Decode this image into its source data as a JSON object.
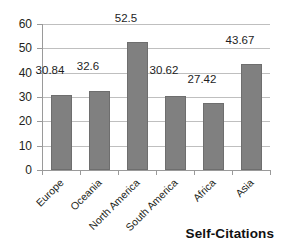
{
  "chart_data": {
    "type": "bar",
    "title": "Self-Citations",
    "xlabel": "",
    "ylabel": "",
    "ylim": [
      0,
      60
    ],
    "ytick_step": 10,
    "yticks": [
      60,
      50,
      40,
      30,
      20,
      10,
      0
    ],
    "grid": true,
    "legend": "none",
    "categories": [
      "Europe",
      "Oceania",
      "North America",
      "South America",
      "Africa",
      "Asia"
    ],
    "values": [
      30.84,
      32.6,
      52.5,
      30.62,
      27.42,
      43.67
    ],
    "data_labels": [
      "30.84",
      "32.6",
      "52.5",
      "30.62",
      "27.42",
      "43.67"
    ],
    "series": [
      {
        "name": "Self-Citations",
        "values": [
          30.84,
          32.6,
          52.5,
          30.62,
          27.42,
          43.67
        ]
      }
    ]
  },
  "style": {
    "bar_fill": "#808080",
    "bar_stroke": "#6e6e6e",
    "gridline_color": "#bfbfbf",
    "axis_color": "#9a9a9a",
    "text_color": "#231f20",
    "background": "#ffffff"
  }
}
